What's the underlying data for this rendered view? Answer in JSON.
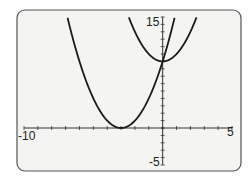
{
  "chart_data": {
    "type": "line",
    "title": "",
    "xlabel": "",
    "ylabel": "",
    "xlim": [
      -10,
      5
    ],
    "ylim": [
      -5,
      15
    ],
    "x_tick_step": 1,
    "y_tick_step": 1,
    "tick_labels": {
      "xmin": "-10",
      "xmax": "5",
      "ymin": "-5",
      "ymax": "15"
    },
    "grid": false,
    "legend": null,
    "series": [
      {
        "name": "y = (x + 3)^2",
        "vertex": [
          -3,
          0
        ],
        "a": 1,
        "h": -3,
        "k": 0
      },
      {
        "name": "y = x^2 + 9",
        "vertex": [
          0,
          9
        ],
        "a": 1,
        "h": 0,
        "k": 9
      }
    ],
    "intersection": [
      0,
      9
    ]
  },
  "colors": {
    "frame": "#555555",
    "background": "#f4f4f2",
    "curve": "#1a1a1a",
    "axis": "#333333"
  }
}
